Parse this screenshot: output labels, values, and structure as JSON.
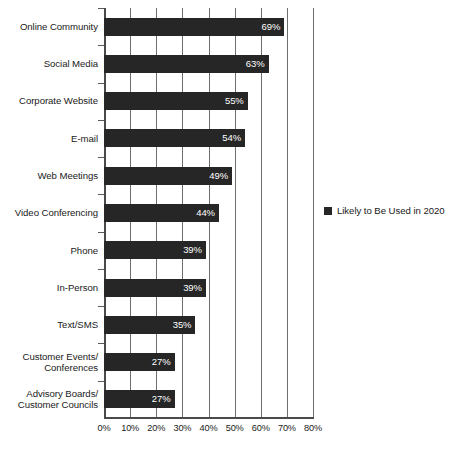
{
  "chart_data": {
    "type": "bar",
    "orientation": "horizontal",
    "title": "",
    "xlabel": "",
    "ylabel": "",
    "xlim": [
      0,
      80
    ],
    "xticks": [
      0,
      10,
      20,
      30,
      40,
      50,
      60,
      70,
      80
    ],
    "xtick_labels": [
      "0%",
      "10%",
      "20%",
      "30%",
      "40%",
      "50%",
      "60%",
      "70%",
      "80%"
    ],
    "grid": true,
    "grid_axis": "x",
    "legend_position": "right",
    "bar_color": "#262626",
    "value_label_color": "#ffffff",
    "categories": [
      "Online Community",
      "Social Media",
      "Corporate Website",
      "E-mail",
      "Web Meetings",
      "Video Conferencing",
      "Phone",
      "In-Person",
      "Text/SMS",
      "Customer Events/\nConferences",
      "Advisory Boards/\nCustomer Councils"
    ],
    "series": [
      {
        "name": "Likely to Be Used in 2020",
        "values": [
          69,
          63,
          55,
          54,
          49,
          44,
          39,
          39,
          35,
          27,
          27
        ],
        "value_labels": [
          "69%",
          "63%",
          "55%",
          "54%",
          "49%",
          "44%",
          "39%",
          "39%",
          "35%",
          "27%",
          "27%"
        ]
      }
    ]
  },
  "legend": {
    "items": [
      {
        "label": "Likely to Be Used in 2020",
        "color": "#262626"
      }
    ]
  }
}
